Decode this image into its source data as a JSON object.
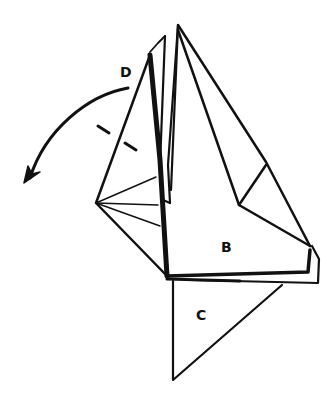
{
  "diagram": {
    "type": "origami-fold-step",
    "labels": {
      "b": "B",
      "c": "C",
      "d": "D"
    },
    "annotations": {
      "arrow": "curved-fold-arrow",
      "dashed_line": "valley-fold-line"
    },
    "colors": {
      "ink": "#111111",
      "paper": "#ffffff"
    }
  }
}
